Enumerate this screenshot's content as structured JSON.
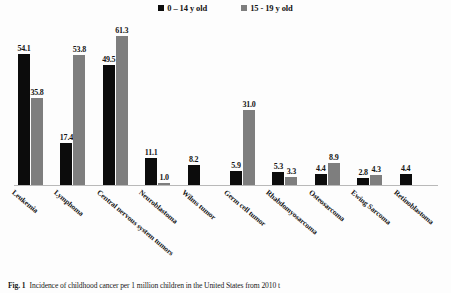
{
  "figure": {
    "caption_label": "Fig. 1",
    "caption_text": "Incidence of childhood cancer per 1 million children in the United States from 2010 t"
  },
  "legend": {
    "position": "top-center",
    "items": [
      {
        "label": "0 – 14 y old",
        "color": "#0c0c0c",
        "swatch_name": "legend-swatch-black"
      },
      {
        "label": "15 - 19 y old",
        "color": "#7e7e7e",
        "swatch_name": "legend-swatch-gray"
      }
    ]
  },
  "chart_data": {
    "type": "bar",
    "title": "",
    "subtitle": "",
    "xlabel": "",
    "ylabel": "",
    "ylim": [
      0,
      66
    ],
    "grid": false,
    "legend_position": "top-center",
    "orientation": "vertical",
    "categories": [
      "Leukemia",
      "Lymphoma",
      "Central nervous system tumors",
      "Neuroblastoma",
      "Wilms tumor",
      "Germ cell tumor",
      "Rhabdomyosarcoma",
      "Osteosarcoma",
      "Ewing Sarcoma",
      "Retinoblastoma"
    ],
    "series": [
      {
        "name": "0 – 14 y old",
        "color": "#0c0c0c",
        "values": [
          54.1,
          17.4,
          49.5,
          11.1,
          8.2,
          5.9,
          5.3,
          4.4,
          2.8,
          4.4
        ],
        "labels": [
          "54.1",
          "17.4",
          "49.5",
          "11.1",
          "8.2",
          "5.9",
          "5.3",
          "4.4",
          "2.8",
          "4.4"
        ]
      },
      {
        "name": "15 - 19 y old",
        "color": "#7e7e7e",
        "values": [
          35.8,
          53.8,
          61.3,
          1.0,
          null,
          31.0,
          3.3,
          8.9,
          4.3,
          null
        ],
        "labels": [
          "35.8",
          "53.8",
          "61.3",
          "1.0",
          "",
          "31.0",
          "3.3",
          "8.9",
          "4.3",
          ""
        ]
      }
    ]
  }
}
